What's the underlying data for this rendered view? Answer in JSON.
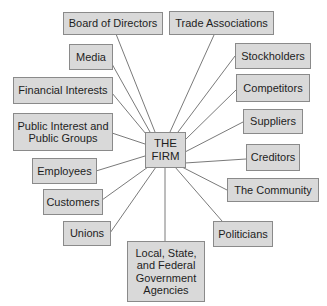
{
  "diagram": {
    "type": "hub-and-spoke stakeholder diagram",
    "center": {
      "label": "THE\nFIRM"
    },
    "stakeholders": [
      {
        "id": "board",
        "label": "Board of Directors"
      },
      {
        "id": "trade",
        "label": "Trade Associations"
      },
      {
        "id": "media",
        "label": "Media"
      },
      {
        "id": "stockholders",
        "label": "Stockholders"
      },
      {
        "id": "financial",
        "label": "Financial Interests"
      },
      {
        "id": "competitors",
        "label": "Competitors"
      },
      {
        "id": "public",
        "label": "Public Interest and\nPublic Groups"
      },
      {
        "id": "suppliers",
        "label": "Suppliers"
      },
      {
        "id": "employees",
        "label": "Employees"
      },
      {
        "id": "creditors",
        "label": "Creditors"
      },
      {
        "id": "customers",
        "label": "Customers"
      },
      {
        "id": "community",
        "label": "The Community"
      },
      {
        "id": "unions",
        "label": "Unions"
      },
      {
        "id": "politicians",
        "label": "Politicians"
      },
      {
        "id": "government",
        "label": "Local, State,\nand Federal\nGovernment\nAgencies"
      }
    ],
    "colors": {
      "box_fill": "#d9d9d9",
      "box_border": "#8a8a8a",
      "connector": "#7a7a7a",
      "text": "#1e1e1e"
    }
  }
}
